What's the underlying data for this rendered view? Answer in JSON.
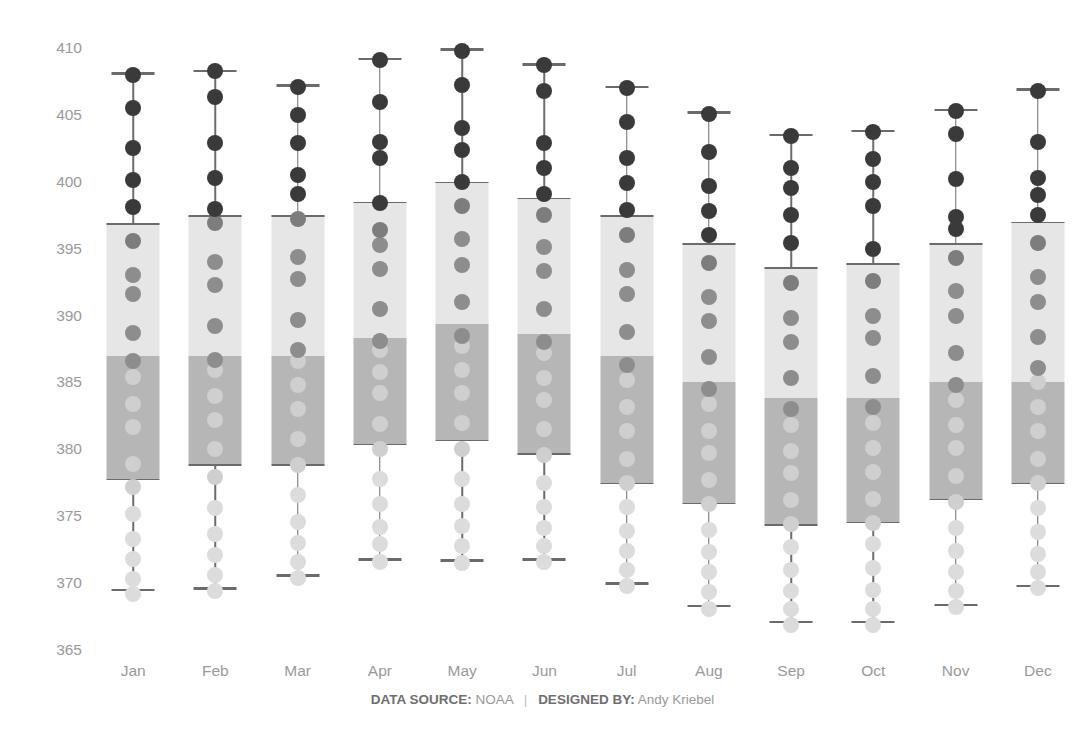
{
  "chart_data": {
    "type": "box",
    "title": "",
    "xlabel": "",
    "ylabel": "CO2 Concentrations",
    "ylim": [
      365,
      410
    ],
    "yticks": [
      410,
      405,
      400,
      395,
      390,
      385,
      380,
      375,
      370,
      365
    ],
    "grid": false,
    "legend": "none",
    "categories": [
      "Jan",
      "Feb",
      "Mar",
      "Apr",
      "May",
      "Jun",
      "Jul",
      "Aug",
      "Sep",
      "Oct",
      "Nov",
      "Dec"
    ],
    "series": [
      {
        "name": "Jan",
        "whisker_low": 369.5,
        "q1": 377.8,
        "median": 387.0,
        "q3": 396.9,
        "whisker_high": 408.1,
        "points": [
          369.2,
          370.3,
          371.8,
          373.3,
          375.2,
          377.2,
          378.9,
          381.7,
          383.4,
          385.4,
          386.6,
          388.7,
          391.6,
          393.0,
          395.6,
          398.1,
          400.1,
          402.5,
          405.5,
          408.0
        ]
      },
      {
        "name": "Feb",
        "whisker_low": 369.6,
        "q1": 378.9,
        "median": 387.0,
        "q3": 397.5,
        "whisker_high": 408.3,
        "points": [
          369.4,
          370.6,
          372.1,
          373.7,
          375.6,
          377.9,
          380.0,
          382.2,
          384.0,
          385.9,
          386.7,
          389.2,
          392.3,
          394.0,
          396.9,
          398.0,
          400.3,
          402.9,
          406.3,
          408.3
        ]
      },
      {
        "name": "Mar",
        "whisker_low": 370.6,
        "q1": 378.9,
        "median": 387.0,
        "q3": 397.5,
        "whisker_high": 407.2,
        "points": [
          370.4,
          371.6,
          373.0,
          374.6,
          376.6,
          378.8,
          380.8,
          383.0,
          384.8,
          386.6,
          387.4,
          389.7,
          392.7,
          394.4,
          397.2,
          399.1,
          400.5,
          402.9,
          405.0,
          407.1
        ]
      },
      {
        "name": "Apr",
        "whisker_low": 371.8,
        "q1": 380.4,
        "median": 388.3,
        "q3": 398.5,
        "whisker_high": 409.2,
        "points": [
          371.6,
          372.9,
          374.2,
          375.9,
          377.8,
          380.0,
          381.9,
          384.2,
          385.8,
          387.4,
          388.1,
          390.5,
          393.5,
          395.3,
          396.4,
          398.4,
          401.8,
          403.0,
          406.0,
          409.1
        ]
      },
      {
        "name": "May",
        "whisker_low": 371.7,
        "q1": 380.7,
        "median": 389.4,
        "q3": 400.0,
        "whisker_high": 409.9,
        "points": [
          371.5,
          372.8,
          374.3,
          375.9,
          377.8,
          380.0,
          382.0,
          384.2,
          385.9,
          387.7,
          388.5,
          391.0,
          393.8,
          395.7,
          398.2,
          400.0,
          402.4,
          404.0,
          407.2,
          409.8
        ]
      },
      {
        "name": "Jun",
        "whisker_low": 371.8,
        "q1": 379.7,
        "median": 388.6,
        "q3": 398.8,
        "whisker_high": 408.8,
        "points": [
          371.6,
          372.8,
          374.1,
          375.7,
          377.5,
          379.6,
          381.5,
          383.7,
          385.3,
          387.2,
          388.0,
          390.5,
          393.3,
          395.1,
          397.5,
          399.1,
          401.0,
          402.9,
          406.8,
          408.7
        ]
      },
      {
        "name": "Jul",
        "whisker_low": 370.0,
        "q1": 377.5,
        "median": 387.0,
        "q3": 397.5,
        "whisker_high": 407.1,
        "points": [
          369.8,
          371.0,
          372.4,
          373.9,
          375.7,
          377.5,
          379.3,
          381.4,
          383.2,
          385.2,
          386.3,
          388.8,
          391.6,
          393.4,
          396.0,
          397.9,
          399.9,
          401.8,
          404.5,
          407.0
        ]
      },
      {
        "name": "Aug",
        "whisker_low": 368.3,
        "q1": 376.0,
        "median": 385.0,
        "q3": 395.4,
        "whisker_high": 405.2,
        "points": [
          368.1,
          369.3,
          370.8,
          372.3,
          374.0,
          375.9,
          377.7,
          379.7,
          381.4,
          383.4,
          384.5,
          386.9,
          389.6,
          391.4,
          393.9,
          396.0,
          397.8,
          399.7,
          402.2,
          405.1
        ]
      },
      {
        "name": "Sep",
        "whisker_low": 367.1,
        "q1": 374.4,
        "median": 383.8,
        "q3": 393.6,
        "whisker_high": 403.5,
        "points": [
          366.9,
          368.1,
          369.4,
          371.0,
          372.7,
          374.4,
          376.2,
          378.2,
          379.9,
          381.8,
          383.0,
          385.3,
          388.0,
          389.8,
          392.4,
          395.4,
          397.5,
          399.5,
          401.0,
          403.4
        ]
      },
      {
        "name": "Oct",
        "whisker_low": 367.1,
        "q1": 374.6,
        "median": 383.8,
        "q3": 393.9,
        "whisker_high": 403.8,
        "points": [
          366.9,
          368.1,
          369.5,
          371.1,
          372.9,
          374.5,
          376.3,
          378.3,
          380.1,
          382.0,
          383.2,
          385.5,
          388.3,
          390.0,
          392.6,
          395.0,
          398.2,
          400.0,
          401.7,
          403.7
        ]
      },
      {
        "name": "Nov",
        "whisker_low": 368.4,
        "q1": 376.3,
        "median": 385.0,
        "q3": 395.4,
        "whisker_high": 405.4,
        "points": [
          368.2,
          369.4,
          370.8,
          372.4,
          374.1,
          376.1,
          378.0,
          380.1,
          381.8,
          383.7,
          384.8,
          387.2,
          390.0,
          391.8,
          394.3,
          396.5,
          397.4,
          400.2,
          403.6,
          405.3
        ]
      },
      {
        "name": "Dec",
        "whisker_low": 369.8,
        "q1": 377.5,
        "median": 385.0,
        "q3": 397.0,
        "whisker_high": 406.9,
        "points": [
          369.6,
          370.8,
          372.2,
          373.8,
          375.6,
          377.5,
          379.3,
          381.4,
          383.2,
          385.0,
          386.1,
          388.4,
          391.0,
          392.9,
          395.4,
          397.5,
          399.0,
          400.3,
          403.0,
          406.8
        ]
      }
    ]
  },
  "axis": {
    "y_title": "CO2 Concentrations",
    "y_ticks": [
      "410",
      "405",
      "400",
      "395",
      "390",
      "385",
      "380",
      "375",
      "370",
      "365"
    ],
    "x_ticks": [
      "Jan",
      "Feb",
      "Mar",
      "Apr",
      "May",
      "Jun",
      "Jul",
      "Aug",
      "Sep",
      "Oct",
      "Nov",
      "Dec"
    ]
  },
  "footer": {
    "data_source_label": "DATA SOURCE:",
    "data_source_value": "NOAA",
    "separator": "|",
    "designed_by_label": "DESIGNED BY:",
    "designed_by_value": "Andy Kriebel"
  },
  "colors": {
    "box_upper": "#e6e6e6",
    "box_lower": "#b6b6b6",
    "box_edge": "#6b6b6b",
    "whisker": "#6d6d6d",
    "dot_dark": "#3a3a3a",
    "dot_mid": "#8d8d8d",
    "dot_light": "#dcdcdc",
    "tick_text": "#9a9a9a",
    "axis_title": "#4a4a4a"
  }
}
